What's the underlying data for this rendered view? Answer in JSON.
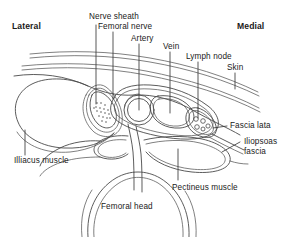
{
  "figure": {
    "type": "anatomical-diagram",
    "line_color": "#4a4a4a",
    "text_color": "#1a1a1a",
    "background": "#ffffff"
  },
  "orientation": {
    "lateral": "Lateral",
    "medial": "Medial"
  },
  "labels": {
    "nerve_sheath": "Nerve sheath",
    "femoral_nerve": "Femoral nerve",
    "artery": "Artery",
    "vein": "Vein",
    "lymph_node": "Lymph node",
    "skin": "Skin",
    "fascia_lata": "Fascia lata",
    "iliopsoas_fascia_line1": "Iliopsoas",
    "iliopsoas_fascia_line2": "fascia",
    "illiacus_muscle": "Illiacus muscle",
    "pectineus_muscle": "Pectineus muscle",
    "femoral_head": "Femoral head"
  }
}
